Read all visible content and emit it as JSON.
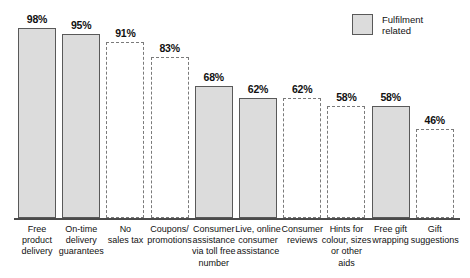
{
  "chart_data": {
    "type": "bar",
    "title": "",
    "subtitle": "",
    "xlabel": "",
    "ylabel": "",
    "ylim": [
      0,
      100
    ],
    "grid": false,
    "legend_position": "top-right",
    "legend": [
      {
        "label_line1": "Fulfilment",
        "label_line2": "related",
        "style": "filled",
        "color": "#dcdcdc"
      }
    ],
    "categories": [
      "Free product delivery",
      "On-time delivery guarantees",
      "No sales tax",
      "Coupons/ promotions",
      "Consumer assistance via toll free number",
      "Live, online consumer assistance",
      "Consumer reviews",
      "Hints for colour, sizes or other aids",
      "Free gift wrapping",
      "Gift suggestions"
    ],
    "values": [
      98,
      95,
      91,
      83,
      68,
      62,
      62,
      58,
      58,
      46
    ],
    "value_labels": [
      "98%",
      "95%",
      "91%",
      "83%",
      "68%",
      "62%",
      "62%",
      "58%",
      "58%",
      "46%"
    ],
    "bar_styles": [
      "filled",
      "filled",
      "outline",
      "outline",
      "filled",
      "filled",
      "outline",
      "outline",
      "filled",
      "outline"
    ],
    "category_label_lines": [
      [
        "Free",
        "product",
        "delivery"
      ],
      [
        "On-time",
        "delivery",
        "guarantees"
      ],
      [
        "No",
        "sales tax"
      ],
      [
        "Coupons/",
        "promotions"
      ],
      [
        "Consumer",
        "assistance",
        "via toll free",
        "number"
      ],
      [
        "Live, online",
        "consumer",
        "assistance"
      ],
      [
        "Consumer",
        "reviews"
      ],
      [
        "Hints for",
        "colour, sizes",
        "or other",
        "aids"
      ],
      [
        "Free gift",
        "wrapping"
      ],
      [
        "Gift",
        "suggestions"
      ]
    ],
    "colors": {
      "bar_fill": "#dcdcdc",
      "bar_stroke": "#595959",
      "outline_stroke": "#7a7a7a",
      "axis": "#4a4a4a",
      "text": "#111111",
      "background": "#ffffff"
    }
  }
}
